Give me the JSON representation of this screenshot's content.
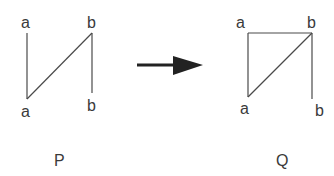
{
  "diagram": {
    "left_graph": {
      "caption": "P",
      "nodes": [
        {
          "id": "a_top",
          "label": "a"
        },
        {
          "id": "b_top",
          "label": "b"
        },
        {
          "id": "a_bottom",
          "label": "a"
        },
        {
          "id": "b_bottom",
          "label": "b"
        }
      ],
      "edges": [
        {
          "from": "a_top",
          "to": "a_bottom"
        },
        {
          "from": "a_bottom",
          "to": "b_top"
        },
        {
          "from": "b_top",
          "to": "b_bottom"
        }
      ]
    },
    "arrow": {
      "direction": "right",
      "color": "#222222"
    },
    "right_graph": {
      "caption": "Q",
      "nodes": [
        {
          "id": "a_top",
          "label": "a"
        },
        {
          "id": "b_top",
          "label": "b"
        },
        {
          "id": "a_bottom",
          "label": "a"
        },
        {
          "id": "b_bottom",
          "label": "b"
        }
      ],
      "edges": [
        {
          "from": "a_top",
          "to": "a_bottom"
        },
        {
          "from": "a_top",
          "to": "b_top"
        },
        {
          "from": "a_bottom",
          "to": "b_top"
        },
        {
          "from": "b_top",
          "to": "b_bottom"
        }
      ]
    }
  }
}
